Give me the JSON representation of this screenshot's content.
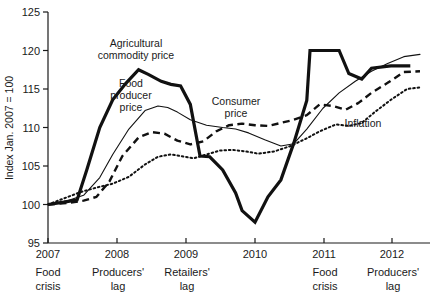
{
  "chart_data": {
    "type": "line",
    "title": "",
    "xlabel": "",
    "ylabel": "Index Jan. 2007 = 100",
    "ylim": [
      95,
      125
    ],
    "xlim": [
      2007,
      2012.75
    ],
    "yticks": [
      "125",
      "120",
      "115",
      "110",
      "105",
      "100",
      "95"
    ],
    "ytick_values": [
      125,
      120,
      115,
      110,
      105,
      100,
      95
    ],
    "xticks": [
      "2007",
      "2008",
      "2009",
      "2010",
      "2011",
      "2012"
    ],
    "xtick_values": [
      2007,
      2008,
      2009,
      2010,
      2011,
      2012
    ],
    "grid": false,
    "legend": "inline-annotations",
    "series": [
      {
        "name": "Agricultural commodity price",
        "style": "thick-solid",
        "x": [
          2007.0,
          2007.25,
          2007.45,
          2007.6,
          2007.8,
          2008.0,
          2008.2,
          2008.4,
          2008.55,
          2008.75,
          2008.9,
          2009.05,
          2009.2,
          2009.35,
          2009.5,
          2009.7,
          2009.9,
          2010.0,
          2010.2,
          2010.4,
          2010.6,
          2010.8,
          2011.0,
          2011.05,
          2011.35,
          2011.5,
          2011.65,
          2011.85,
          2012.0,
          2012.3,
          2012.6
        ],
        "y": [
          100.0,
          100.3,
          100.6,
          104.5,
          110.0,
          113.6,
          115.7,
          117.5,
          116.9,
          116.0,
          115.6,
          115.4,
          113.0,
          106.3,
          106.2,
          104.5,
          101.5,
          99.2,
          97.7,
          101.0,
          103.2,
          108.0,
          113.5,
          120.0,
          120.0,
          120.0,
          117.0,
          116.3,
          117.7,
          118.0,
          118.0
        ]
      },
      {
        "name": "Food producer price",
        "style": "thin-solid",
        "x": [
          2007.0,
          2007.3,
          2007.55,
          2007.8,
          2008.0,
          2008.25,
          2008.5,
          2008.7,
          2008.85,
          2009.0,
          2009.2,
          2009.45,
          2009.7,
          2009.9,
          2010.1,
          2010.35,
          2010.6,
          2010.8,
          2011.0,
          2011.25,
          2011.5,
          2011.75,
          2012.0,
          2012.25,
          2012.5,
          2012.75
        ],
        "y": [
          100.0,
          100.5,
          101.2,
          103.5,
          106.5,
          109.8,
          112.2,
          112.8,
          112.6,
          112.0,
          111.0,
          110.3,
          110.0,
          109.8,
          109.3,
          108.4,
          107.6,
          107.9,
          109.8,
          112.5,
          114.5,
          116.0,
          117.3,
          118.3,
          119.2,
          119.5
        ]
      },
      {
        "name": "Consumer price",
        "style": "dashed",
        "x": [
          2007.0,
          2007.3,
          2007.55,
          2007.75,
          2007.95,
          2008.15,
          2008.4,
          2008.6,
          2008.8,
          2009.0,
          2009.2,
          2009.4,
          2009.6,
          2009.8,
          2010.0,
          2010.2,
          2010.4,
          2010.6,
          2010.8,
          2011.0,
          2011.2,
          2011.4,
          2011.6,
          2011.8,
          2012.0,
          2012.25,
          2012.5,
          2012.75
        ],
        "y": [
          100.0,
          100.2,
          100.5,
          101.0,
          103.0,
          106.3,
          108.7,
          109.4,
          109.2,
          108.3,
          107.8,
          108.2,
          109.5,
          110.3,
          110.5,
          110.3,
          110.2,
          110.6,
          111.0,
          111.6,
          113.0,
          112.8,
          112.3,
          113.2,
          114.5,
          115.8,
          117.2,
          117.3
        ]
      },
      {
        "name": "Inflation",
        "style": "dotted",
        "x": [
          2007.0,
          2007.25,
          2007.5,
          2007.75,
          2008.0,
          2008.25,
          2008.5,
          2008.7,
          2008.9,
          2009.05,
          2009.25,
          2009.45,
          2009.65,
          2009.85,
          2010.05,
          2010.25,
          2010.5,
          2010.75,
          2011.0,
          2011.2,
          2011.45,
          2011.65,
          2011.85,
          2012.05,
          2012.3,
          2012.55,
          2012.75
        ],
        "y": [
          100.0,
          100.8,
          101.6,
          102.2,
          102.7,
          103.6,
          105.2,
          106.2,
          106.5,
          106.3,
          106.0,
          106.5,
          107.0,
          107.1,
          106.9,
          106.6,
          106.9,
          107.6,
          108.6,
          109.5,
          110.4,
          110.2,
          110.6,
          112.0,
          113.6,
          115.0,
          115.2
        ]
      }
    ],
    "series_labels": [
      {
        "text_line1": "Agricultural",
        "text_line2": "commodity price"
      },
      {
        "text_line1": "Food",
        "text_line2": "producer",
        "text_line3": "price"
      },
      {
        "text_line1": "Consumer",
        "text_line2": "price"
      },
      {
        "text_line1": "Inflation"
      }
    ],
    "phase_annotations": [
      {
        "line1": "Food",
        "line2": "crisis"
      },
      {
        "line1": "Producers'",
        "line2": "lag"
      },
      {
        "line1": "Retailers'",
        "line2": "lag"
      },
      {
        "line1": "Food",
        "line2": "crisis"
      },
      {
        "line1": "Producers'",
        "line2": "lag"
      }
    ],
    "colors": {
      "ink": "#111111",
      "background": "#ffffff"
    }
  }
}
